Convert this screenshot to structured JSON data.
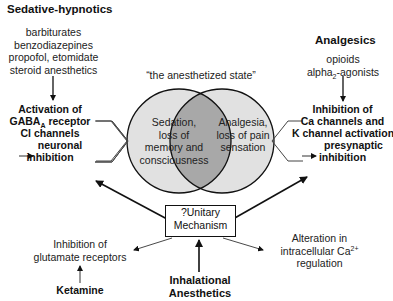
{
  "sedative_hypnotics": {
    "heading": "Sedative-hypnotics",
    "drugs": [
      "barbiturates",
      "benzodiazepines",
      "propofol, etomidate",
      "steroid anesthetics"
    ],
    "mechanism": {
      "line1": "Activation of",
      "line2_pre": "GABA",
      "line2_sub": "A",
      "line2_post": " receptor",
      "line3": "Cl channels",
      "line4": "neuronal",
      "line5": "inhibition"
    }
  },
  "analgesics": {
    "heading": "Analgesics",
    "drugs": {
      "line1": "opioids",
      "line2_pre": "alpha",
      "line2_sub": "2",
      "line2_post": "-agonists"
    },
    "mechanism": {
      "line1": "Inhibition of",
      "line2": "Ca channels and",
      "line3": "K channel activation",
      "line4": "presynaptic",
      "line5": "inhibition"
    }
  },
  "venn": {
    "title": "“the anesthetized state”",
    "left": [
      "Sedation,",
      "loss of",
      "memory and",
      "consciousness"
    ],
    "right": [
      "Analgesia,",
      "loss of pain",
      "sensation"
    ],
    "colors": {
      "left_fill": "#e0e0e0",
      "right_fill": "#e0e0e0",
      "overlap_fill": "#a9a9a9",
      "stroke": "#111111"
    }
  },
  "unitary_mechanism": {
    "line1": "?Unitary",
    "line2": "Mechanism"
  },
  "glutamate": {
    "line1": "Inhibition of",
    "line2": "glutamate receptors"
  },
  "ketamine": {
    "label": "Ketamine"
  },
  "inhalational": {
    "line1": "Inhalational",
    "line2": "Anesthetics"
  },
  "calcium": {
    "line1": "Alteration in",
    "line2_pre": "intracellular Ca",
    "line2_sup": "2+",
    "line3": "regulation"
  }
}
